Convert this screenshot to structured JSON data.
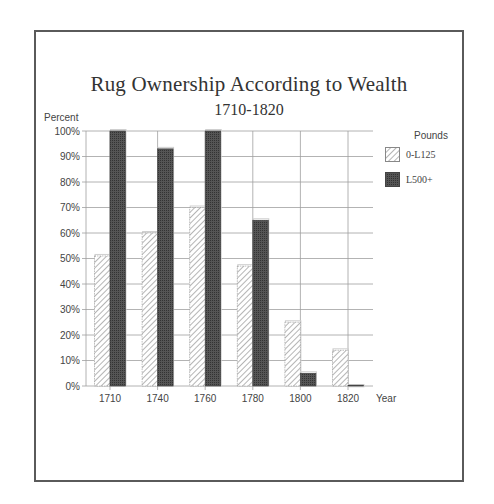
{
  "chart_data": {
    "type": "bar",
    "title": "Rug Ownership According to Wealth",
    "subtitle": "1710-1820",
    "xlabel": "Year",
    "ylabel": "Percent",
    "categories": [
      "1710",
      "1740",
      "1760",
      "1780",
      "1800",
      "1820"
    ],
    "series": [
      {
        "name": "0-L125",
        "pattern": "hatched",
        "values": [
          51,
          60,
          70,
          47,
          25,
          14
        ]
      },
      {
        "name": "L500+",
        "pattern": "solid-dark",
        "values": [
          100,
          93,
          100,
          65,
          5,
          0
        ]
      }
    ],
    "ylim": [
      0,
      100
    ],
    "yticks": [
      "0%",
      "10%",
      "20%",
      "30%",
      "40%",
      "50%",
      "60%",
      "70%",
      "80%",
      "90%",
      "100%"
    ],
    "legend_title": "Pounds",
    "legend_position": "right",
    "grid": true,
    "colors": {
      "dark_bar": "#4a4a4a",
      "hatch": "#777777",
      "grid": "#9a9a9a",
      "frame": "#5a5a5a"
    }
  }
}
